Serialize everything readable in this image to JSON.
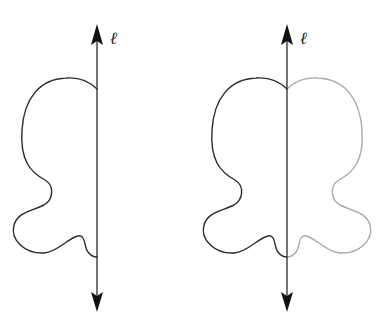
{
  "figures": [
    {
      "id": "left",
      "description": "Half of a shape drawn on one side of line ℓ",
      "axis": {
        "label": "ℓ",
        "x": 97,
        "top_y": 24,
        "bottom_y": 312
      },
      "halves": [
        "left (dark)"
      ]
    },
    {
      "id": "right",
      "description": "Same half-shape reflected across line ℓ to complete a symmetric figure",
      "axis": {
        "label": "ℓ",
        "x": 287,
        "top_y": 24,
        "bottom_y": 312
      },
      "halves": [
        "left (dark)",
        "right (light gray, reflection)"
      ]
    }
  ],
  "colors": {
    "original_curve": "#2b2b2b",
    "reflected_curve": "#a9a9a9",
    "axis": "#2a2a2a",
    "background": "#ffffff"
  },
  "labels": {
    "left_axis": "ℓ",
    "right_axis": "ℓ"
  }
}
